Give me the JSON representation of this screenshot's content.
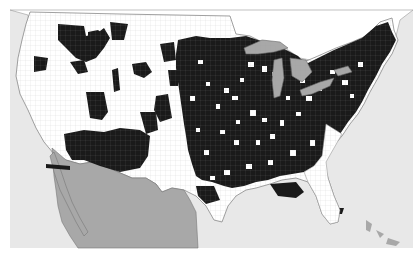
{
  "map": {
    "type": "choropleth",
    "subject": "US counties, binary shading",
    "colors": {
      "ocean": "#e8e8e8",
      "counties_unshaded": "#ffffff",
      "counties_shaded": "#1a1a1a",
      "mexico": "#a8a8a8",
      "great_lakes": "#a8a8a8",
      "canada": "#ffffff",
      "borders": "#888888"
    },
    "legend": null,
    "labels": []
  }
}
